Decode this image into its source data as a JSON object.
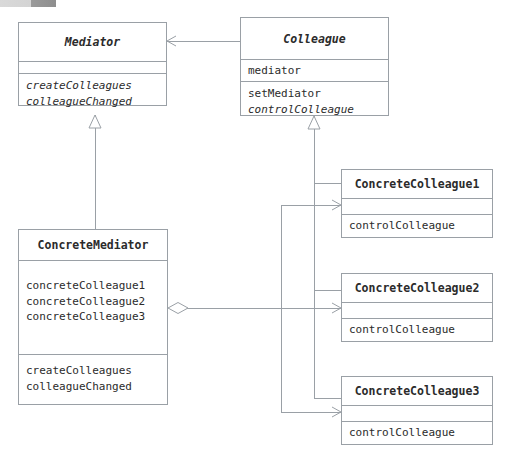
{
  "diagram": {
    "type": "uml-class-diagram",
    "pattern_name": "Mediator",
    "top_chip_label": "",
    "classes": [
      {
        "id": "mediator",
        "name": "Mediator",
        "abstract": true,
        "attributes": [],
        "methods": [
          {
            "name": "createColleagues",
            "abstract": true
          },
          {
            "name": "colleagueChanged",
            "abstract": true
          }
        ]
      },
      {
        "id": "colleague",
        "name": "Colleague",
        "abstract": true,
        "attributes": [
          {
            "name": "mediator",
            "abstract": false
          }
        ],
        "methods": [
          {
            "name": "setMediator",
            "abstract": false
          },
          {
            "name": "controlColleague",
            "abstract": true
          }
        ]
      },
      {
        "id": "concrete-mediator",
        "name": "ConcreteMediator",
        "abstract": false,
        "attributes": [
          {
            "name": "concreteColleague1",
            "abstract": false
          },
          {
            "name": "concreteColleague2",
            "abstract": false
          },
          {
            "name": "concreteColleague3",
            "abstract": false
          }
        ],
        "methods": [
          {
            "name": "createColleagues",
            "abstract": false
          },
          {
            "name": "colleagueChanged",
            "abstract": false
          }
        ]
      },
      {
        "id": "concrete-colleague-1",
        "name": "ConcreteColleague1",
        "abstract": false,
        "attributes": [],
        "methods": [
          {
            "name": "controlColleague",
            "abstract": false
          }
        ]
      },
      {
        "id": "concrete-colleague-2",
        "name": "ConcreteColleague2",
        "abstract": false,
        "attributes": [],
        "methods": [
          {
            "name": "controlColleague",
            "abstract": false
          }
        ]
      },
      {
        "id": "concrete-colleague-3",
        "name": "ConcreteColleague3",
        "abstract": false,
        "attributes": [],
        "methods": [
          {
            "name": "controlColleague",
            "abstract": false
          }
        ]
      }
    ],
    "relationships": [
      {
        "id": "rel-colleague-aggregates-mediator",
        "kind": "aggregation",
        "source": "colleague",
        "target": "mediator",
        "label": ""
      },
      {
        "id": "rel-concrete-mediator-extends-mediator",
        "kind": "generalization",
        "source": "concrete-mediator",
        "target": "mediator",
        "label": ""
      },
      {
        "id": "rel-cc1-extends-colleague",
        "kind": "generalization",
        "source": "concrete-colleague-1",
        "target": "colleague",
        "label": ""
      },
      {
        "id": "rel-cc2-extends-colleague",
        "kind": "generalization",
        "source": "concrete-colleague-2",
        "target": "colleague",
        "label": ""
      },
      {
        "id": "rel-cc3-extends-colleague",
        "kind": "generalization",
        "source": "concrete-colleague-3",
        "target": "colleague",
        "label": ""
      },
      {
        "id": "rel-concrete-mediator-aggregates-cc1",
        "kind": "aggregation",
        "source": "concrete-mediator",
        "target": "concrete-colleague-1",
        "label": ""
      },
      {
        "id": "rel-concrete-mediator-aggregates-cc2",
        "kind": "aggregation",
        "source": "concrete-mediator",
        "target": "concrete-colleague-2",
        "label": ""
      },
      {
        "id": "rel-concrete-mediator-aggregates-cc3",
        "kind": "aggregation",
        "source": "concrete-mediator",
        "target": "concrete-colleague-3",
        "label": ""
      }
    ]
  },
  "colors": {
    "stroke": "#9aa0a6",
    "text": "#2b2b2b",
    "background": "#ffffff",
    "chip_light": "#d9d9d9",
    "chip_dark": "#8e8e8e"
  }
}
